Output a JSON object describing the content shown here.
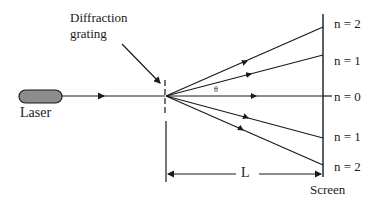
{
  "diagram": {
    "labels": {
      "grating": [
        "Diffraction",
        "grating"
      ],
      "laser": "Laser",
      "screen": "Screen",
      "distance": "L",
      "angle": "θ"
    },
    "orders": [
      {
        "label": "n = 2",
        "position": "top"
      },
      {
        "label": "n = 1",
        "position": "upper"
      },
      {
        "label": "n = 0",
        "position": "center"
      },
      {
        "label": "n = 1",
        "position": "lower"
      },
      {
        "label": "n = 2",
        "position": "bottom"
      }
    ],
    "colors": {
      "line": "#1a1a1a",
      "laser_fill": "#8c8c8c",
      "background": "#ffffff"
    }
  }
}
